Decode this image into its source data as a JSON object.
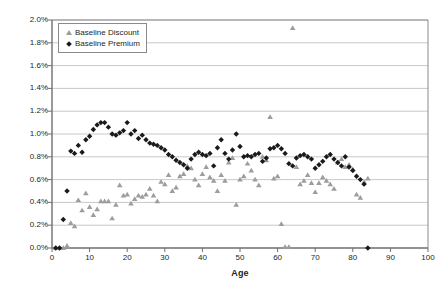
{
  "chart_data": {
    "type": "scatter",
    "title": "",
    "xlabel": "Age",
    "ylabel": "SMM",
    "xlim": [
      0,
      100
    ],
    "ylim": [
      0,
      0.02
    ],
    "grid": true,
    "legend_position": "top-left",
    "y_tick_labels": [
      "2.0%",
      "1.8%",
      "1.6%",
      "1.4%",
      "1.2%",
      "1.0%",
      "0.8%",
      "0.6%",
      "0.4%",
      "0.2%",
      "0.0%"
    ],
    "y_tick_values": [
      0.02,
      0.018,
      0.016,
      0.014,
      0.012,
      0.01,
      0.008,
      0.006,
      0.004,
      0.002,
      0
    ],
    "x_tick_labels": [
      "0",
      "10",
      "20",
      "30",
      "40",
      "50",
      "60",
      "70",
      "80",
      "90",
      "100"
    ],
    "x_tick_values": [
      0,
      10,
      20,
      30,
      40,
      50,
      60,
      70,
      80,
      90,
      100
    ],
    "series": [
      {
        "name": "Baseline Discount",
        "marker": "triangle",
        "color": "#9d9d9d",
        "points": [
          [
            1,
            0.0
          ],
          [
            2,
            0.0
          ],
          [
            3,
            0.0
          ],
          [
            4,
            0.0002
          ],
          [
            5,
            0.0022
          ],
          [
            6,
            0.0019
          ],
          [
            7,
            0.0042
          ],
          [
            8,
            0.0033
          ],
          [
            9,
            0.0048
          ],
          [
            10,
            0.0036
          ],
          [
            11,
            0.0029
          ],
          [
            12,
            0.0034
          ],
          [
            13,
            0.0041
          ],
          [
            14,
            0.0041
          ],
          [
            15,
            0.0041
          ],
          [
            16,
            0.0026
          ],
          [
            17,
            0.0038
          ],
          [
            18,
            0.0055
          ],
          [
            19,
            0.0046
          ],
          [
            20,
            0.0047
          ],
          [
            21,
            0.0039
          ],
          [
            22,
            0.0043
          ],
          [
            23,
            0.0046
          ],
          [
            24,
            0.0045
          ],
          [
            25,
            0.0047
          ],
          [
            26,
            0.0052
          ],
          [
            27,
            0.0046
          ],
          [
            28,
            0.0041
          ],
          [
            29,
            0.0058
          ],
          [
            30,
            0.0056
          ],
          [
            31,
            0.0064
          ],
          [
            32,
            0.005
          ],
          [
            33,
            0.0053
          ],
          [
            34,
            0.0063
          ],
          [
            35,
            0.0065
          ],
          [
            36,
            0.0072
          ],
          [
            37,
            0.007
          ],
          [
            38,
            0.006
          ],
          [
            39,
            0.0055
          ],
          [
            40,
            0.0065
          ],
          [
            41,
            0.0071
          ],
          [
            42,
            0.0062
          ],
          [
            43,
            0.0059
          ],
          [
            44,
            0.005
          ],
          [
            45,
            0.0064
          ],
          [
            46,
            0.0059
          ],
          [
            47,
            0.0075
          ],
          [
            48,
            0.0079
          ],
          [
            49,
            0.0038
          ],
          [
            50,
            0.006
          ],
          [
            51,
            0.0063
          ],
          [
            52,
            0.0074
          ],
          [
            53,
            0.0068
          ],
          [
            54,
            0.006
          ],
          [
            55,
            0.0055
          ],
          [
            56,
            0.008
          ],
          [
            57,
            0.0077
          ],
          [
            58,
            0.0115
          ],
          [
            59,
            0.0061
          ],
          [
            60,
            0.0063
          ],
          [
            61,
            0.0021
          ],
          [
            62,
            0.0001
          ],
          [
            63,
            0.0001
          ],
          [
            64,
            0.0193
          ],
          [
            65,
            0.0071
          ],
          [
            66,
            0.0056
          ],
          [
            67,
            0.0059
          ],
          [
            68,
            0.0064
          ],
          [
            69,
            0.0057
          ],
          [
            70,
            0.0049
          ],
          [
            71,
            0.0057
          ],
          [
            72,
            0.0062
          ],
          [
            73,
            0.0059
          ],
          [
            74,
            0.0056
          ],
          [
            75,
            0.0052
          ],
          [
            76,
            0.0075
          ],
          [
            77,
            0.0078
          ],
          [
            78,
            0.0071
          ],
          [
            79,
            0.0073
          ],
          [
            80,
            0.0069
          ],
          [
            81,
            0.0047
          ],
          [
            82,
            0.0044
          ],
          [
            83,
            0.0058
          ],
          [
            84,
            0.0061
          ]
        ]
      },
      {
        "name": "Baseline Premium",
        "marker": "diamond",
        "color": "#1a1a1a",
        "points": [
          [
            1,
            0.0
          ],
          [
            2,
            0.0
          ],
          [
            3,
            0.0025
          ],
          [
            4,
            0.005
          ],
          [
            5,
            0.0085
          ],
          [
            6,
            0.0083
          ],
          [
            7,
            0.009
          ],
          [
            8,
            0.0084
          ],
          [
            9,
            0.0095
          ],
          [
            10,
            0.0098
          ],
          [
            11,
            0.0104
          ],
          [
            12,
            0.0108
          ],
          [
            13,
            0.011
          ],
          [
            14,
            0.011
          ],
          [
            15,
            0.0106
          ],
          [
            16,
            0.01
          ],
          [
            17,
            0.0099
          ],
          [
            18,
            0.0101
          ],
          [
            19,
            0.0103
          ],
          [
            20,
            0.011
          ],
          [
            21,
            0.01
          ],
          [
            22,
            0.0103
          ],
          [
            23,
            0.0096
          ],
          [
            24,
            0.0099
          ],
          [
            25,
            0.0095
          ],
          [
            26,
            0.0092
          ],
          [
            27,
            0.0091
          ],
          [
            28,
            0.009
          ],
          [
            29,
            0.0088
          ],
          [
            30,
            0.0086
          ],
          [
            31,
            0.0082
          ],
          [
            32,
            0.008
          ],
          [
            33,
            0.0077
          ],
          [
            34,
            0.0075
          ],
          [
            35,
            0.0073
          ],
          [
            36,
            0.007
          ],
          [
            37,
            0.0078
          ],
          [
            38,
            0.0082
          ],
          [
            39,
            0.0084
          ],
          [
            40,
            0.0082
          ],
          [
            41,
            0.0081
          ],
          [
            42,
            0.0083
          ],
          [
            43,
            0.0072
          ],
          [
            44,
            0.0088
          ],
          [
            45,
            0.0095
          ],
          [
            46,
            0.0083
          ],
          [
            47,
            0.0078
          ],
          [
            48,
            0.0086
          ],
          [
            49,
            0.01
          ],
          [
            50,
            0.0089
          ],
          [
            51,
            0.008
          ],
          [
            52,
            0.0081
          ],
          [
            53,
            0.008
          ],
          [
            54,
            0.0082
          ],
          [
            55,
            0.0083
          ],
          [
            56,
            0.0076
          ],
          [
            57,
            0.0079
          ],
          [
            58,
            0.0087
          ],
          [
            59,
            0.0088
          ],
          [
            60,
            0.009
          ],
          [
            61,
            0.0087
          ],
          [
            62,
            0.0083
          ],
          [
            63,
            0.0074
          ],
          [
            64,
            0.0072
          ],
          [
            65,
            0.0079
          ],
          [
            66,
            0.0081
          ],
          [
            67,
            0.0082
          ],
          [
            68,
            0.008
          ],
          [
            69,
            0.0078
          ],
          [
            70,
            0.007
          ],
          [
            71,
            0.0073
          ],
          [
            72,
            0.0076
          ],
          [
            73,
            0.008
          ],
          [
            74,
            0.0082
          ],
          [
            75,
            0.0078
          ],
          [
            76,
            0.0075
          ],
          [
            77,
            0.0072
          ],
          [
            78,
            0.008
          ],
          [
            79,
            0.0071
          ],
          [
            80,
            0.0068
          ],
          [
            81,
            0.0063
          ],
          [
            82,
            0.006
          ],
          [
            83,
            0.0056
          ],
          [
            84,
            0.0
          ]
        ]
      }
    ]
  },
  "legend": {
    "items": [
      {
        "label": "Baseline Discount"
      },
      {
        "label": "Baseline Premium"
      }
    ]
  }
}
